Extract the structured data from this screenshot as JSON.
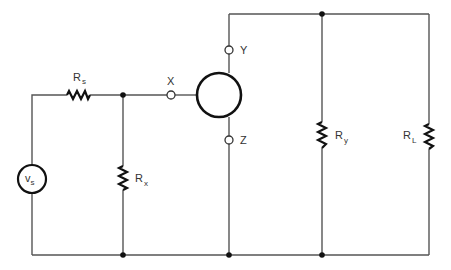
{
  "diagram": {
    "type": "circuit-schematic",
    "components": {
      "source": {
        "label": "v",
        "sub": "s"
      },
      "rs": {
        "label": "R",
        "sub": "s"
      },
      "rx": {
        "label": "R",
        "sub": "x"
      },
      "ry": {
        "label": "R",
        "sub": "y"
      },
      "rl": {
        "label": "R",
        "sub": "L"
      },
      "device": {
        "name": "three-terminal element"
      }
    },
    "terminals": {
      "x": "X",
      "y": "Y",
      "z": "Z"
    }
  }
}
